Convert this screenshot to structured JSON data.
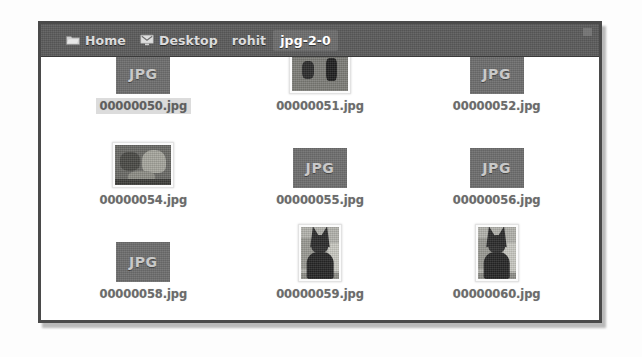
{
  "window": {
    "pathbar": {
      "crumbs": [
        {
          "label": "Home",
          "icon": "home-folder-icon",
          "current": false
        },
        {
          "label": "Desktop",
          "icon": "desktop-monitor-icon",
          "current": false
        },
        {
          "label": "rohit",
          "icon": "",
          "current": false
        },
        {
          "label": "jpg-2-0",
          "icon": "",
          "current": true
        }
      ],
      "corner_nub": "window-control-nub"
    },
    "file_grid": {
      "rows": [
        [
          {
            "name": "00000050.jpg",
            "thumb": "jpg-placeholder",
            "badge": "JPG",
            "selected": true,
            "art": ""
          },
          {
            "name": "00000051.jpg",
            "thumb": "photo",
            "badge": "",
            "selected": false,
            "art": "misc-landscape"
          },
          {
            "name": "00000052.jpg",
            "thumb": "jpg-placeholder",
            "badge": "JPG",
            "selected": false,
            "art": ""
          }
        ],
        [
          {
            "name": "00000054.jpg",
            "thumb": "photo",
            "badge": "",
            "selected": false,
            "art": "landscape-photo"
          },
          {
            "name": "00000055.jpg",
            "thumb": "jpg-placeholder",
            "badge": "JPG",
            "selected": false,
            "art": ""
          },
          {
            "name": "00000056.jpg",
            "thumb": "jpg-placeholder",
            "badge": "JPG",
            "selected": false,
            "art": ""
          }
        ],
        [
          {
            "name": "00000058.jpg",
            "thumb": "jpg-placeholder",
            "badge": "JPG",
            "selected": false,
            "art": ""
          },
          {
            "name": "00000059.jpg",
            "thumb": "photo",
            "badge": "",
            "selected": false,
            "art": "dog-portrait"
          },
          {
            "name": "00000060.jpg",
            "thumb": "photo",
            "badge": "",
            "selected": false,
            "art": "dog-portrait"
          }
        ]
      ]
    }
  },
  "colors": {
    "pathbar_bg": "#5c5c5c",
    "window_border": "#4a4a4a",
    "selection_bg": "#dcdcdc",
    "filename_text": "#6b6b6b",
    "jpg_icon_bg": "#6e6e6e",
    "jpg_icon_text": "#c9c9c9"
  }
}
